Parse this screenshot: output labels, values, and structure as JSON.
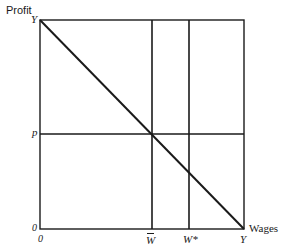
{
  "diagram": {
    "y_axis_label": "Profit",
    "x_axis_label": "Wages",
    "labels": {
      "top_left_Y": "Y",
      "profit_level": "p",
      "origin_y": "0",
      "origin_x": "0",
      "w_bar": "W",
      "w_star": "W*",
      "bottom_right_Y": "Y"
    },
    "geometry": {
      "box": {
        "left": 40,
        "top": 20,
        "right": 244,
        "bottom": 229
      },
      "vertical_lines_x": [
        152,
        189
      ],
      "horizontal_line_y": 134,
      "diagonal": {
        "from": [
          40,
          20
        ],
        "to": [
          244,
          229
        ]
      }
    },
    "line_color": "#1a1a1a"
  }
}
